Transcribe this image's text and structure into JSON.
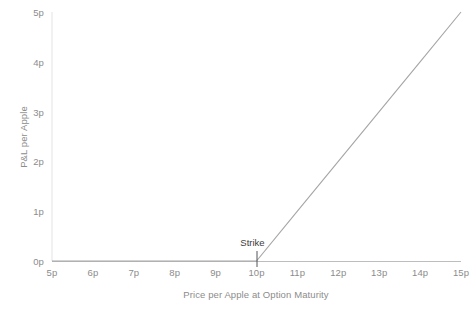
{
  "chart_data": {
    "type": "line",
    "title": "",
    "xlabel": "Price per Apple at Option Maturity",
    "ylabel": "P&L per Apple",
    "xlim": [
      5,
      15
    ],
    "ylim": [
      0,
      5
    ],
    "grid": false,
    "legend": null,
    "x_tick_labels": [
      "5p",
      "6p",
      "7p",
      "8p",
      "9p",
      "10p",
      "11p",
      "12p",
      "13p",
      "14p",
      "15p"
    ],
    "x_tick_values": [
      5,
      6,
      7,
      8,
      9,
      10,
      11,
      12,
      13,
      14,
      15
    ],
    "y_tick_labels": [
      "0p",
      "1p",
      "2p",
      "3p",
      "4p",
      "5p"
    ],
    "y_tick_values": [
      0,
      1,
      2,
      3,
      4,
      5
    ],
    "series": [
      {
        "name": "Long call payoff",
        "x": [
          5,
          6,
          7,
          8,
          9,
          10,
          11,
          12,
          13,
          14,
          15
        ],
        "values": [
          0,
          0,
          0,
          0,
          0,
          0,
          1,
          2,
          3,
          4,
          5
        ],
        "color": "#a6a6a6"
      }
    ],
    "annotations": [
      {
        "label": "Strike",
        "x": 10,
        "y": 0,
        "marker": "vertical-tick"
      }
    ],
    "colors": {
      "line": "#a6a6a6",
      "axis": "#e3e3e3",
      "zero_line": "#bdbdbd",
      "tick_text": "#8c8c8c",
      "annotation_text": "#3d3d3d",
      "background": "#ffffff"
    }
  }
}
